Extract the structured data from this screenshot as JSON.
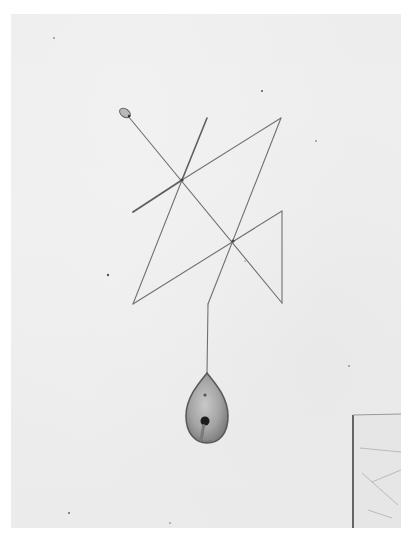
{
  "image": {
    "description": "Black-and-white photograph of a wire sculpture hanging on a white wall: an angular zig-zag of thin rods forming crossed triangles, with a teardrop-shaped pendant hanging from a vertical wire below, and the edge of a framed panel at lower right.",
    "colors": {
      "wall": "#ececec",
      "wire": "#6e6e6e",
      "pendant_body": "#9a9a9a",
      "pendant_outline": "#5a5a5a",
      "panel_edge": "#4a4a4a"
    }
  }
}
